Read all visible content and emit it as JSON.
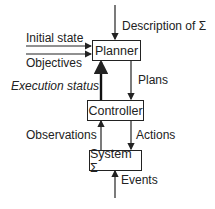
{
  "diagram": {
    "nodes": {
      "planner": "Planner",
      "controller": "Controller",
      "system": "System Σ"
    },
    "labels": {
      "description": "Description of Σ",
      "initial_state": "Initial state",
      "objectives": "Objectives",
      "execution_status": "Execution status",
      "plans": "Plans",
      "observations": "Observations",
      "actions": "Actions",
      "events": "Events"
    },
    "edges": [
      {
        "from": "Description of Σ",
        "to": "Planner"
      },
      {
        "from": "Initial state",
        "to": "Planner"
      },
      {
        "from": "Objectives",
        "to": "Planner"
      },
      {
        "from": "Planner",
        "to": "Controller",
        "label": "Plans"
      },
      {
        "from": "Controller",
        "to": "Planner",
        "label": "Execution status",
        "bold": true
      },
      {
        "from": "System Σ",
        "to": "Controller",
        "label": "Observations"
      },
      {
        "from": "Controller",
        "to": "System Σ",
        "label": "Actions"
      },
      {
        "from": "Events",
        "to": "System Σ"
      }
    ]
  }
}
